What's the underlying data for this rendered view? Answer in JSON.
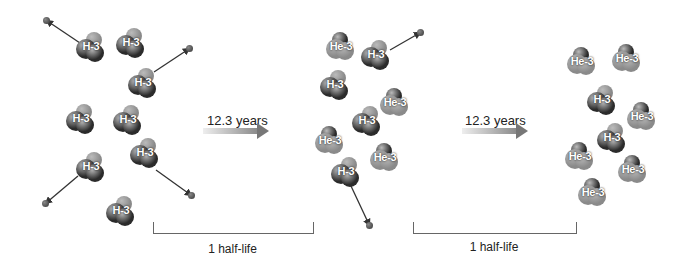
{
  "colors": {
    "dark_atom": "#2b2b2b",
    "light_atom": "#8a8a8a",
    "arrow": "#333333",
    "text": "#222222"
  },
  "stages": [
    {
      "name": "initial",
      "molecules": [
        {
          "label": "H-3",
          "x": 76,
          "y": 32,
          "type": "H"
        },
        {
          "label": "H-3",
          "x": 116,
          "y": 28,
          "type": "H"
        },
        {
          "label": "H-3",
          "x": 128,
          "y": 68,
          "type": "H"
        },
        {
          "label": "H-3",
          "x": 66,
          "y": 104,
          "type": "H"
        },
        {
          "label": "H-3",
          "x": 113,
          "y": 105,
          "type": "H"
        },
        {
          "label": "H-3",
          "x": 76,
          "y": 152,
          "type": "H"
        },
        {
          "label": "H-3",
          "x": 130,
          "y": 138,
          "type": "H"
        },
        {
          "label": "H-3",
          "x": 106,
          "y": 196,
          "type": "H"
        }
      ]
    },
    {
      "name": "after-1-half-life",
      "molecules": [
        {
          "label": "He-3",
          "x": 326,
          "y": 32,
          "type": "He"
        },
        {
          "label": "H-3",
          "x": 361,
          "y": 40,
          "type": "H"
        },
        {
          "label": "H-3",
          "x": 320,
          "y": 70,
          "type": "H"
        },
        {
          "label": "He-3",
          "x": 380,
          "y": 88,
          "type": "He"
        },
        {
          "label": "H-3",
          "x": 352,
          "y": 106,
          "type": "H"
        },
        {
          "label": "He-3",
          "x": 315,
          "y": 126,
          "type": "He"
        },
        {
          "label": "He-3",
          "x": 370,
          "y": 143,
          "type": "He"
        },
        {
          "label": "H-3",
          "x": 331,
          "y": 157,
          "type": "H"
        }
      ]
    },
    {
      "name": "after-2-half-lives",
      "molecules": [
        {
          "label": "He-3",
          "x": 567,
          "y": 47,
          "type": "He"
        },
        {
          "label": "He-3",
          "x": 612,
          "y": 44,
          "type": "He"
        },
        {
          "label": "H-3",
          "x": 587,
          "y": 85,
          "type": "H"
        },
        {
          "label": "He-3",
          "x": 627,
          "y": 102,
          "type": "He"
        },
        {
          "label": "H-3",
          "x": 597,
          "y": 123,
          "type": "H"
        },
        {
          "label": "He-3",
          "x": 565,
          "y": 142,
          "type": "He"
        },
        {
          "label": "He-3",
          "x": 618,
          "y": 155,
          "type": "He"
        },
        {
          "label": "He-3",
          "x": 578,
          "y": 178,
          "type": "He"
        }
      ]
    }
  ],
  "electrons": [
    {
      "x": 43,
      "y": 17,
      "from_x": 80,
      "from_y": 43
    },
    {
      "x": 186,
      "y": 45,
      "from_x": 154,
      "from_y": 72
    },
    {
      "x": 42,
      "y": 200,
      "from_x": 78,
      "from_y": 176
    },
    {
      "x": 188,
      "y": 192,
      "from_x": 156,
      "from_y": 170
    },
    {
      "x": 417,
      "y": 29,
      "from_x": 390,
      "from_y": 50
    },
    {
      "x": 366,
      "y": 222,
      "from_x": 351,
      "from_y": 186
    }
  ],
  "arrows": [
    {
      "label": "12.3 years",
      "x": 203,
      "y": 128,
      "label_x": 207,
      "label_y": 113
    },
    {
      "label": "12.3 years",
      "x": 462,
      "y": 128,
      "label_x": 465,
      "label_y": 113
    }
  ],
  "brackets": [
    {
      "label": "1 half-life",
      "x": 153,
      "y": 222,
      "w": 159,
      "label_y": 242
    },
    {
      "label": "1 half-life",
      "x": 413,
      "y": 222,
      "w": 162,
      "label_y": 240
    }
  ]
}
